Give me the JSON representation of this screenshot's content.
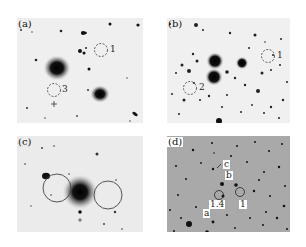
{
  "figure": {
    "panels": [
      {
        "id": "a",
        "label": "(a)",
        "apertures": [
          "1",
          "3"
        ],
        "marker": "+"
      },
      {
        "id": "b",
        "label": "(b)",
        "apertures": [
          "1",
          "2"
        ]
      },
      {
        "id": "c",
        "label": "(c)",
        "apertures": []
      },
      {
        "id": "d",
        "label": "(d)",
        "labels": [
          "a",
          "b",
          "c",
          "1.4",
          "1"
        ]
      }
    ]
  }
}
